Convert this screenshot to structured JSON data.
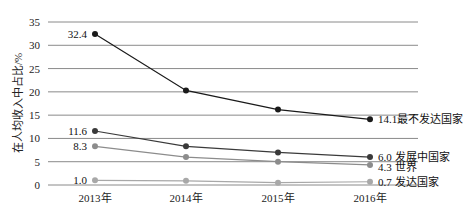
{
  "chart_data": {
    "type": "line",
    "title": "",
    "xlabel": "",
    "ylabel": "在人均收入中占比/%",
    "ylim": [
      0,
      35
    ],
    "yticks": [
      0,
      5,
      10,
      15,
      20,
      25,
      30,
      35
    ],
    "grid": true,
    "legend": "inline labels at series ends",
    "categories": [
      "2013年",
      "2014年",
      "2015年",
      "2016年"
    ],
    "series": [
      {
        "name": "最不发达国家",
        "color": "#1a1a1a",
        "values": [
          32.4,
          20.3,
          16.2,
          14.1
        ],
        "start_label": "32.4",
        "end_label": "14.1最不发达国家"
      },
      {
        "name": "发展中国家",
        "color": "#3a3a3a",
        "values": [
          11.6,
          8.3,
          7.0,
          6.0
        ],
        "start_label": "11.6",
        "end_label": "6.0 发展中国家"
      },
      {
        "name": "世界",
        "color": "#8c8c8c",
        "values": [
          8.3,
          6.0,
          5.0,
          4.3
        ],
        "start_label": "8.3",
        "end_label": "4.3 世界"
      },
      {
        "name": "发达国家",
        "color": "#a8a8a8",
        "values": [
          1.0,
          0.9,
          0.5,
          0.7
        ],
        "start_label": "1.0",
        "end_label": "0.7 发达国家"
      }
    ]
  }
}
